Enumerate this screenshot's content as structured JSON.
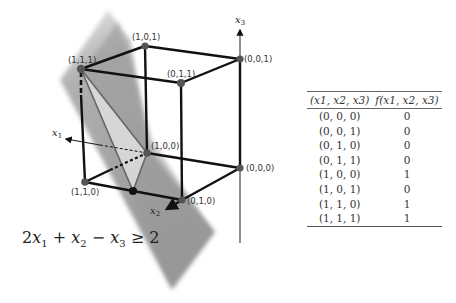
{
  "diagram": {
    "axes": {
      "x1": "x1",
      "x2": "x2",
      "x3": "x3"
    },
    "vertices": [
      {
        "label": "(1,1,1)",
        "x": 81,
        "y": 69
      },
      {
        "label": "(1,0,1)",
        "x": 145,
        "y": 46
      },
      {
        "label": "(0,0,1)",
        "x": 240,
        "y": 59
      },
      {
        "label": "(0,1,1)",
        "x": 181,
        "y": 83
      },
      {
        "label": "(1,1,0)",
        "x": 85,
        "y": 182
      },
      {
        "label": "(1,0,0)",
        "x": 147,
        "y": 153
      },
      {
        "label": "(0,0,0)",
        "x": 240,
        "y": 168
      },
      {
        "label": "(0,1,0)",
        "x": 182,
        "y": 200
      }
    ],
    "inequality": {
      "text": "2x1 + x2 − x3 ≥ 2",
      "coef_x1": "2",
      "plus": "+",
      "minus": "−",
      "geq": "≥",
      "rhs": "2"
    },
    "colors": {
      "edge": "#111111",
      "vertex": "#555555",
      "plane": "#8a8a8a",
      "region": "#d9d9d9"
    }
  },
  "table": {
    "headers": [
      "(x1, x2, x3)",
      "f(x1, x2, x3)"
    ],
    "rows": [
      {
        "input": "(0, 0, 0)",
        "output": "0"
      },
      {
        "input": "(0, 0, 1)",
        "output": "0"
      },
      {
        "input": "(0, 1, 0)",
        "output": "0"
      },
      {
        "input": "(0, 1, 1)",
        "output": "0"
      },
      {
        "input": "(1, 0, 0)",
        "output": "1"
      },
      {
        "input": "(1, 0, 1)",
        "output": "0"
      },
      {
        "input": "(1, 1, 0)",
        "output": "1"
      },
      {
        "input": "(1, 1, 1)",
        "output": "1"
      }
    ]
  }
}
